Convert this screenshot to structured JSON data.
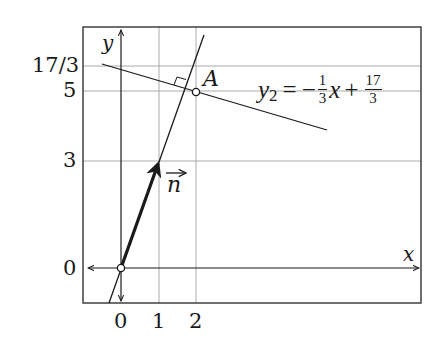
{
  "diagram": {
    "type": "coordinate-plot",
    "axes": {
      "x_label": "x",
      "y_label": "y"
    },
    "x_ticks": [
      {
        "label": "0",
        "value": 0
      },
      {
        "label": "1",
        "value": 1
      },
      {
        "label": "2",
        "value": 2
      }
    ],
    "y_ticks": [
      {
        "label": "0",
        "value": 0
      },
      {
        "label": "3",
        "value": 3
      },
      {
        "label": "5",
        "value": 5
      },
      {
        "label": "17/3",
        "value": 5.667
      }
    ],
    "line_equation": {
      "lhs": "y",
      "lhs_sub": "2",
      "equals": "=",
      "minus": "−",
      "coef_num": "1",
      "coef_den": "3",
      "var": "x",
      "plus": "+",
      "const_num": "17",
      "const_den": "3"
    },
    "point_label": "A",
    "point": {
      "x": 2,
      "y": 5
    },
    "vector_label": "n",
    "vector": {
      "from": [
        0,
        0
      ],
      "to": [
        1,
        3
      ]
    },
    "perpendicular_line": "y = 3x",
    "colors": {
      "ink": "#1a1a1a",
      "grid": "#9a9a9a",
      "background": "#ffffff"
    }
  }
}
